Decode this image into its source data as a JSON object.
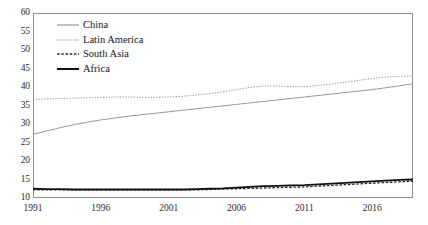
{
  "chart_data": {
    "type": "line",
    "title": "",
    "xlabel": "",
    "ylabel": "",
    "xlim": [
      1991,
      2019
    ],
    "ylim": [
      10,
      60
    ],
    "ytick_values": [
      10,
      15,
      20,
      25,
      30,
      35,
      40,
      45,
      50,
      55,
      60
    ],
    "ytick_labels": [
      "10",
      "15",
      "20",
      "25",
      "30",
      "35",
      "40",
      "45",
      "50",
      "55",
      "60"
    ],
    "xtick_values": [
      1991,
      1996,
      2001,
      2006,
      2011,
      2016
    ],
    "xtick_labels": [
      "1991",
      "1996",
      "2001",
      "2006",
      "2011",
      "2016"
    ],
    "grid": false,
    "legend_position": "top-left-inside",
    "x": [
      1991,
      1992,
      1993,
      1994,
      1995,
      1996,
      1997,
      1998,
      1999,
      2000,
      2001,
      2002,
      2003,
      2004,
      2005,
      2006,
      2007,
      2008,
      2009,
      2010,
      2011,
      2012,
      2013,
      2014,
      2015,
      2016,
      2017,
      2018,
      2019
    ],
    "series": [
      {
        "name": "China",
        "style": "solid-thin",
        "color": "#8c8c8c",
        "values": [
          27.2,
          28.1,
          29.0,
          29.8,
          30.5,
          31.1,
          31.6,
          32.1,
          32.5,
          32.9,
          33.3,
          33.7,
          34.1,
          34.5,
          34.9,
          35.3,
          35.7,
          36.1,
          36.5,
          36.9,
          37.3,
          37.7,
          38.1,
          38.5,
          38.9,
          39.3,
          39.8,
          40.3,
          40.9
        ]
      },
      {
        "name": "Latin America",
        "style": "dotted",
        "color": "#8c8c8c",
        "values": [
          36.6,
          36.8,
          36.9,
          37.0,
          37.1,
          37.2,
          37.3,
          37.3,
          37.2,
          37.2,
          37.3,
          37.5,
          37.8,
          38.2,
          38.7,
          39.3,
          39.9,
          40.3,
          40.3,
          40.1,
          40.1,
          40.4,
          40.8,
          41.3,
          41.8,
          42.3,
          42.7,
          42.9,
          43.0
        ]
      },
      {
        "name": "South Asia",
        "style": "dashed",
        "color": "#2b2b2b",
        "values": [
          12.2,
          12.2,
          12.2,
          12.2,
          12.2,
          12.2,
          12.2,
          12.2,
          12.2,
          12.2,
          12.2,
          12.2,
          12.2,
          12.3,
          12.4,
          12.5,
          12.6,
          12.7,
          12.8,
          12.9,
          13.0,
          13.2,
          13.4,
          13.6,
          13.8,
          14.0,
          14.2,
          14.4,
          14.5
        ]
      },
      {
        "name": "Africa",
        "style": "solid-thick",
        "color": "#111111",
        "values": [
          12.5,
          12.4,
          12.4,
          12.3,
          12.3,
          12.3,
          12.3,
          12.3,
          12.3,
          12.3,
          12.3,
          12.3,
          12.4,
          12.5,
          12.6,
          12.8,
          13.0,
          13.2,
          13.3,
          13.4,
          13.5,
          13.7,
          13.9,
          14.1,
          14.3,
          14.5,
          14.7,
          14.9,
          15.0
        ]
      }
    ]
  },
  "legend": {
    "items": [
      {
        "label": "China"
      },
      {
        "label": "Latin America"
      },
      {
        "label": "South Asia"
      },
      {
        "label": "Africa"
      }
    ]
  }
}
